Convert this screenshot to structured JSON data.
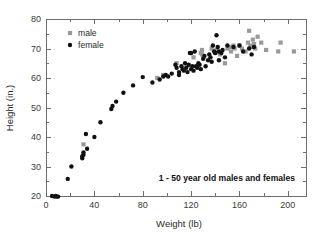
{
  "chart_data": {
    "type": "scatter",
    "title": "",
    "xlabel": "Weight (lb)",
    "ylabel": "Height (in.)",
    "xlim": [
      0,
      215
    ],
    "ylim": [
      20,
      80
    ],
    "xticks": [
      0,
      40,
      80,
      120,
      160,
      200
    ],
    "yticks": [
      20,
      30,
      40,
      50,
      60,
      70,
      80
    ],
    "xtick_labels": [
      "0",
      "40",
      "80",
      "120",
      "160",
      "200"
    ],
    "ytick_labels": [
      "20",
      "30",
      "40",
      "50",
      "60",
      "70",
      "80"
    ],
    "minor_tick_interval_x": 20,
    "minor_tick_interval_y": 5,
    "grid": false,
    "legend_position": "upper-left-inside",
    "annotation": "1 - 50 year old males and females",
    "colors": {
      "male": "#9a9a9a",
      "female": "#111111",
      "axis": "#6e6e6e",
      "background": "#ffffff"
    },
    "series": [
      {
        "name": "male",
        "marker": "square",
        "color": "#9a9a9a",
        "points": [
          [
            31,
            37.5
          ],
          [
            92,
            60.0
          ],
          [
            97,
            61.0
          ],
          [
            108,
            65.0
          ],
          [
            122,
            67.0
          ],
          [
            128,
            68.5
          ],
          [
            129,
            69.5
          ],
          [
            129,
            68.0
          ],
          [
            130,
            67.0
          ],
          [
            137,
            70.0
          ],
          [
            140,
            68.5
          ],
          [
            141,
            69.5
          ],
          [
            144,
            68.0
          ],
          [
            148,
            65.0
          ],
          [
            150,
            70.0
          ],
          [
            152,
            70.5
          ],
          [
            153,
            69.0
          ],
          [
            155,
            71.0
          ],
          [
            156,
            70.0
          ],
          [
            158,
            67.5
          ],
          [
            160,
            71.0
          ],
          [
            162,
            70.0
          ],
          [
            165,
            69.0
          ],
          [
            167,
            72.0
          ],
          [
            168,
            76.0
          ],
          [
            169,
            71.0
          ],
          [
            170,
            70.5
          ],
          [
            171,
            73.0
          ],
          [
            172,
            71.5
          ],
          [
            173,
            70.0
          ],
          [
            175,
            74.0
          ],
          [
            178,
            72.0
          ],
          [
            182,
            69.5
          ],
          [
            192,
            69.0
          ],
          [
            194,
            72.0
          ],
          [
            205,
            69.0
          ]
        ]
      },
      {
        "name": "female",
        "marker": "circle",
        "color": "#111111",
        "points": [
          [
            5,
            20.0
          ],
          [
            7,
            19.8
          ],
          [
            8,
            20.0
          ],
          [
            9,
            19.8
          ],
          [
            10,
            19.8
          ],
          [
            18,
            25.8
          ],
          [
            21,
            30.0
          ],
          [
            30,
            33.5
          ],
          [
            30,
            32.8
          ],
          [
            31,
            34.0
          ],
          [
            31,
            34.8
          ],
          [
            33,
            41.0
          ],
          [
            34,
            36.0
          ],
          [
            40,
            40.0
          ],
          [
            45,
            45.0
          ],
          [
            54,
            49.5
          ],
          [
            55,
            50.5
          ],
          [
            58,
            52.0
          ],
          [
            64,
            55.0
          ],
          [
            72,
            57.5
          ],
          [
            80,
            60.3
          ],
          [
            88,
            58.5
          ],
          [
            94,
            59.5
          ],
          [
            97,
            60.5
          ],
          [
            99,
            61.0
          ],
          [
            101,
            60.5
          ],
          [
            104,
            61.5
          ],
          [
            107,
            64.5
          ],
          [
            108,
            63.5
          ],
          [
            110,
            62.0
          ],
          [
            110,
            61.0
          ],
          [
            112,
            64.0
          ],
          [
            113,
            63.0
          ],
          [
            114,
            62.5
          ],
          [
            115,
            65.0
          ],
          [
            116,
            63.5
          ],
          [
            117,
            62.0
          ],
          [
            118,
            64.5
          ],
          [
            119,
            68.5
          ],
          [
            120,
            68.5
          ],
          [
            120,
            63.0
          ],
          [
            121,
            64.0
          ],
          [
            122,
            62.5
          ],
          [
            123,
            69.0
          ],
          [
            124,
            64.0
          ],
          [
            125,
            63.5
          ],
          [
            126,
            65.0
          ],
          [
            127,
            64.5
          ],
          [
            128,
            63.0
          ],
          [
            130,
            66.5
          ],
          [
            131,
            67.5
          ],
          [
            132,
            64.0
          ],
          [
            134,
            66.0
          ],
          [
            135,
            68.0
          ],
          [
            136,
            67.0
          ],
          [
            137,
            65.5
          ],
          [
            138,
            71.0
          ],
          [
            139,
            69.0
          ],
          [
            140,
            68.5
          ],
          [
            141,
            74.5
          ],
          [
            142,
            70.5
          ],
          [
            143,
            69.0
          ],
          [
            143,
            66.0
          ],
          [
            145,
            68.5
          ],
          [
            146,
            69.5
          ],
          [
            148,
            67.0
          ],
          [
            150,
            71.0
          ],
          [
            155,
            70.5
          ],
          [
            160,
            71.0
          ],
          [
            163,
            69.0
          ],
          [
            168,
            70.0
          ],
          [
            170,
            68.0
          ],
          [
            172,
            70.5
          ]
        ]
      }
    ]
  },
  "legend": {
    "items": [
      {
        "label": "male",
        "marker": "square",
        "color": "#9a9a9a"
      },
      {
        "label": "female",
        "marker": "circle",
        "color": "#111111"
      }
    ]
  },
  "axes": {
    "x_title": "Weight (lb)",
    "y_title": "Height (in.)"
  },
  "annotation": {
    "text": "1 - 50 year old males and females"
  }
}
